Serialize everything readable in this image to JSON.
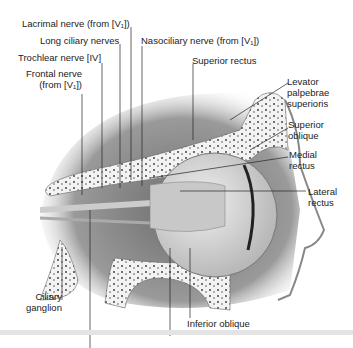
{
  "figure": {
    "labels": {
      "lacrimal_nerve": "Lacrimal nerve (from [V₁])",
      "long_ciliary_nerves": "Long ciliary nerves",
      "trochlear_nerve": "Trochlear nerve [IV]",
      "frontal_nerve_1": "Frontal nerve",
      "frontal_nerve_2": "(from [V₁])",
      "nasociliary_nerve": "Nasociliary nerve (from [V₁])",
      "superior_rectus": "Superior rectus",
      "levator_1": "Levator",
      "levator_2": "palpebrae",
      "levator_3": "superioris",
      "superior_oblique_1": "Superior",
      "superior_oblique_2": "oblique",
      "medial_rectus_1": "Medial",
      "medial_rectus_2": "rectus",
      "lateral_rectus_1": "Lateral",
      "lateral_rectus_2": "rectus",
      "ciliary_ganglion_1": "Ciliary",
      "ciliary_ganglion_2": "ganglion",
      "inferior_oblique": "Inferior oblique"
    },
    "colors": {
      "bone": "#f2f2f2",
      "tissue": "#8a8a8a",
      "muscle": "#b5b5b5",
      "eye": "#dedede",
      "line": "#222222"
    }
  }
}
